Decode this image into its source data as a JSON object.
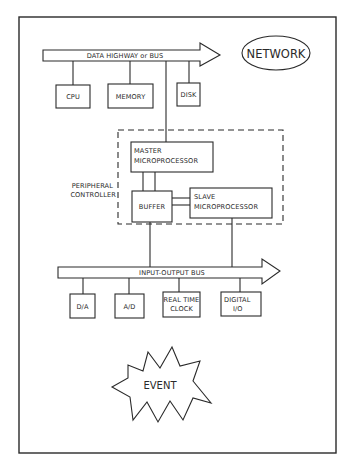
{
  "diagram": {
    "network": {
      "label": "NETWORK"
    },
    "data_bus": {
      "label": "DATA HIGHWAY or BUS"
    },
    "data_bus_devices": [
      {
        "id": "cpu",
        "label": "CPU"
      },
      {
        "id": "memory",
        "label": "MEMORY"
      },
      {
        "id": "disk",
        "label": "DISK"
      }
    ],
    "peripheral_controller": {
      "label_line1": "PERIPHERAL",
      "label_line2": "CONTROLLER",
      "master": {
        "line1": "MASTER",
        "line2": "MICROPROCESSOR"
      },
      "buffer": {
        "label": "BUFFER"
      },
      "slave": {
        "line1": "SLAVE",
        "line2": "MICROPROCESSOR"
      }
    },
    "io_bus": {
      "label": "INPUT-OUTPUT BUS"
    },
    "io_devices": [
      {
        "id": "da",
        "line1": "D/A",
        "line2": ""
      },
      {
        "id": "ad",
        "line1": "A/D",
        "line2": ""
      },
      {
        "id": "rtc",
        "line1": "REAL TIME",
        "line2": "CLOCK"
      },
      {
        "id": "dio",
        "line1": "DIGITAL",
        "line2": "I/O"
      }
    ],
    "event": {
      "label": "EVENT"
    }
  }
}
